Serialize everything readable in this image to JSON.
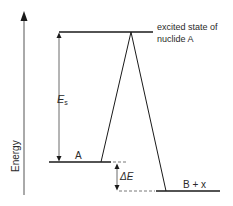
{
  "diagram": {
    "axis_label": "Energy",
    "excited_label_line1": "excited state of",
    "excited_label_line2": "nuclide A",
    "es_label_main": "E",
    "es_label_sub": "s",
    "level_a_label": "A",
    "delta_e_label": "ΔE",
    "level_b_label": "B + x",
    "colors": {
      "line": "#1a1a1a",
      "text": "#2a2a2a",
      "dashed": "#555555"
    }
  }
}
